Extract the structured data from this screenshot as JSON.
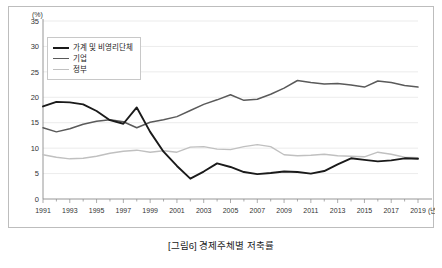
{
  "caption": "[그림6] 경제주체별 저축률",
  "chart_data": {
    "type": "line",
    "title": "[그림6] 경제주체별 저축률",
    "xlabel": "(년)",
    "ylabel": "(%)",
    "y_unit_label": "(%)",
    "x_unit_label": "(년)",
    "ylim": [
      0,
      35
    ],
    "ytick_labels": [
      "0",
      "5",
      "10",
      "15",
      "20",
      "25",
      "30",
      "35"
    ],
    "yticks": [
      0,
      5,
      10,
      15,
      20,
      25,
      30,
      35
    ],
    "xlim": [
      1991,
      2019
    ],
    "xtick_labels": [
      "1991",
      "1993",
      "1995",
      "1997",
      "1999",
      "2001",
      "2003",
      "2005",
      "2007",
      "2009",
      "2011",
      "2013",
      "2015",
      "2017",
      "2019"
    ],
    "xticks": [
      1991,
      1993,
      1995,
      1997,
      1999,
      2001,
      2003,
      2005,
      2007,
      2009,
      2011,
      2013,
      2015,
      2017,
      2019
    ],
    "grid": true,
    "legend_position": "upper-left",
    "x": [
      1991,
      1992,
      1993,
      1994,
      1995,
      1996,
      1997,
      1998,
      1999,
      2000,
      2001,
      2002,
      2003,
      2004,
      2005,
      2006,
      2007,
      2008,
      2009,
      2010,
      2011,
      2012,
      2013,
      2014,
      2015,
      2016,
      2017,
      2018,
      2019
    ],
    "series": [
      {
        "name": "가계 및 비영리단체",
        "color": "#1a1a1a",
        "width": 1.9,
        "values": [
          18.2,
          19.1,
          19.0,
          18.6,
          17.3,
          15.5,
          14.8,
          18.0,
          13.2,
          9.3,
          6.5,
          4.0,
          5.4,
          7.0,
          6.3,
          5.3,
          4.9,
          5.1,
          5.4,
          5.3,
          5.0,
          5.5,
          6.8,
          8.0,
          7.7,
          7.4,
          7.6,
          8.0,
          7.9
        ]
      },
      {
        "name": "기업",
        "color": "#5a5a5a",
        "width": 1.5,
        "values": [
          14.0,
          13.2,
          13.8,
          14.7,
          15.3,
          15.6,
          15.2,
          14.0,
          15.1,
          15.6,
          16.2,
          17.4,
          18.6,
          19.5,
          20.5,
          19.4,
          19.6,
          20.6,
          21.8,
          23.3,
          22.9,
          22.6,
          22.7,
          22.4,
          22.0,
          23.2,
          22.9,
          22.3,
          22.0
        ]
      },
      {
        "name": "정부",
        "color": "#c0c0c0",
        "width": 1.4,
        "values": [
          8.7,
          8.2,
          7.9,
          8.0,
          8.4,
          9.0,
          9.4,
          9.6,
          9.2,
          9.5,
          9.2,
          10.2,
          10.3,
          9.8,
          9.7,
          10.3,
          10.7,
          10.3,
          8.7,
          8.5,
          8.6,
          8.8,
          8.5,
          8.4,
          8.3,
          9.2,
          8.8,
          8.2,
          8.1
        ]
      }
    ]
  }
}
